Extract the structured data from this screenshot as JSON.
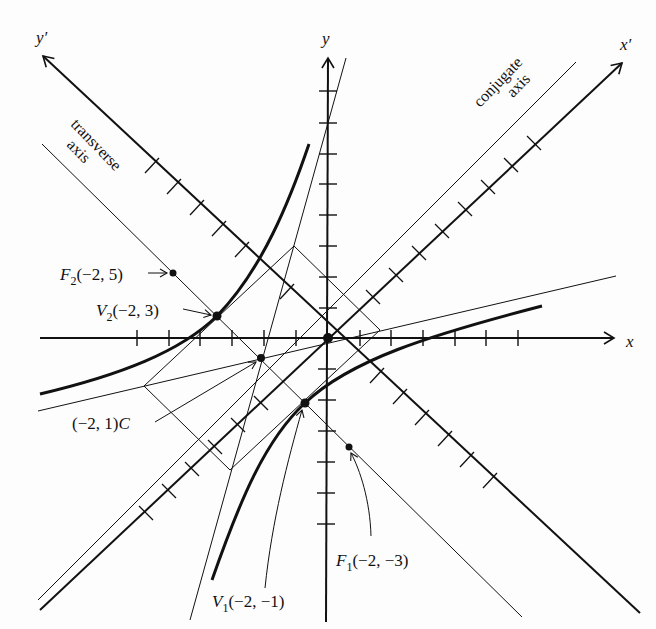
{
  "diagram": {
    "type": "rotated hyperbola with translated center",
    "colors": {
      "ink": "#111111",
      "background": "#fdfdfd"
    },
    "axes": {
      "x": {
        "label": "x"
      },
      "y": {
        "label": "y"
      },
      "x_prime": {
        "label": "x′"
      },
      "y_prime": {
        "label": "y′"
      }
    },
    "axis_labels": {
      "transverse": [
        "transverse",
        "axis"
      ],
      "conjugate": [
        "conjugate",
        "axis"
      ]
    },
    "points": {
      "F2": {
        "name": "F",
        "sub": "2",
        "coords": "(−2, 5)"
      },
      "V2": {
        "name": "V",
        "sub": "2",
        "coords": "(−2, 3)"
      },
      "C": {
        "name": "C",
        "coords": "(−2, 1)"
      },
      "V1": {
        "name": "V",
        "sub": "1",
        "coords": "(−2, −1)"
      },
      "F1": {
        "name": "F",
        "sub": "1",
        "coords": "(−2, −3)"
      }
    }
  }
}
